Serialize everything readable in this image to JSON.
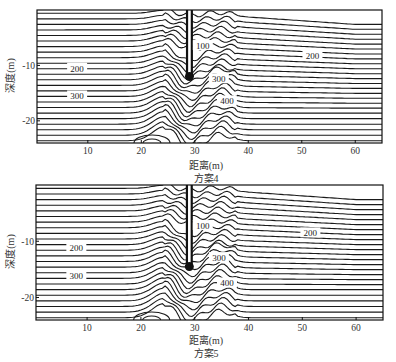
{
  "chart_data": [
    {
      "type": "contour",
      "title": "方案4",
      "xlabel": "距离(m)",
      "ylabel": "深度(m)",
      "xlim": [
        0.5,
        65
      ],
      "ylim": [
        -24,
        0
      ],
      "xticks": [
        10,
        20,
        30,
        40,
        50,
        60
      ],
      "yticks": [
        -10,
        -20
      ],
      "grid": false,
      "pile": {
        "x": 29,
        "top": 0,
        "bottom": -12
      },
      "contour_labels": [
        {
          "text": "200",
          "x": 8,
          "y": -10.6
        },
        {
          "text": "300",
          "x": 8,
          "y": -15.6
        },
        {
          "text": "100",
          "x": 31.5,
          "y": -6.5
        },
        {
          "text": "300",
          "x": 34.5,
          "y": -12.5
        },
        {
          "text": "400",
          "x": 36,
          "y": -16.5
        },
        {
          "text": "200",
          "x": 52,
          "y": -8.3
        }
      ],
      "contour_levels_step": 20,
      "contour_count": 24
    },
    {
      "type": "contour",
      "title": "方案5",
      "xlabel": "距离(m)",
      "ylabel": "深度(m)",
      "xlim": [
        0.5,
        65
      ],
      "ylim": [
        -24,
        0
      ],
      "xticks": [
        10,
        20,
        30,
        40,
        50,
        60
      ],
      "yticks": [
        -10,
        -20
      ],
      "grid": false,
      "pile": {
        "x": 29,
        "top": 0,
        "bottom": -14.5
      },
      "contour_labels": [
        {
          "text": "200",
          "x": 8,
          "y": -11.2
        },
        {
          "text": "300",
          "x": 8,
          "y": -16.2
        },
        {
          "text": "100",
          "x": 31.5,
          "y": -7.3
        },
        {
          "text": "300",
          "x": 34.5,
          "y": -13.0
        },
        {
          "text": "400",
          "x": 36,
          "y": -17.5
        },
        {
          "text": "200",
          "x": 51.5,
          "y": -8.6
        }
      ],
      "contour_levels_step": 20,
      "contour_count": 24
    }
  ],
  "panels": [
    {
      "xlabel": "距离(m)",
      "caption": "方案4",
      "ylabel": "深度(m)"
    },
    {
      "xlabel": "距离(m)",
      "caption": "方案5",
      "ylabel": "深度(m)"
    }
  ]
}
